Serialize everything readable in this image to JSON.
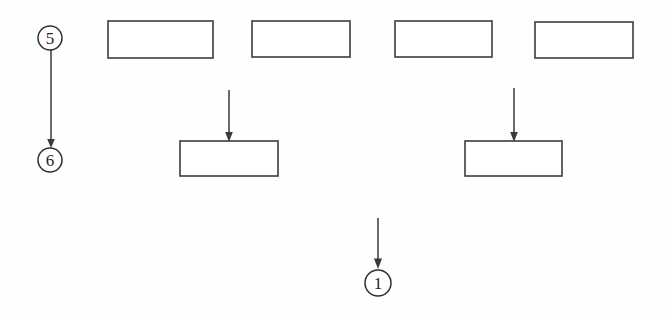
{
  "figure": {
    "title": "",
    "background_color": "#fefefe",
    "line_color": "#3a3a3a",
    "box_fill_color": "#ffffff",
    "width": 671,
    "height": 320
  },
  "boxes": [
    {
      "id": "box-top-1",
      "label": "",
      "x": 108,
      "y": 21,
      "w": 105,
      "h": 37
    },
    {
      "id": "box-top-2",
      "label": "",
      "x": 252,
      "y": 21,
      "w": 98,
      "h": 36
    },
    {
      "id": "box-top-3",
      "label": "",
      "x": 395,
      "y": 21,
      "w": 97,
      "h": 36
    },
    {
      "id": "box-top-4",
      "label": "",
      "x": 535,
      "y": 22,
      "w": 98,
      "h": 36
    },
    {
      "id": "box-mid-1",
      "label": "",
      "x": 180,
      "y": 141,
      "w": 98,
      "h": 35
    },
    {
      "id": "box-mid-2",
      "label": "",
      "x": 465,
      "y": 141,
      "w": 97,
      "h": 35
    }
  ],
  "reference_numerals": [
    {
      "id": "ref-5",
      "text": "5",
      "cx": 50,
      "cy": 38,
      "r": 12
    },
    {
      "id": "ref-6",
      "text": "6",
      "cx": 50,
      "cy": 160,
      "r": 12
    },
    {
      "id": "ref-1",
      "text": "1",
      "cx": 378,
      "cy": 283,
      "r": 13
    }
  ],
  "arrows": [
    {
      "id": "arrow-5-to-6",
      "x": 51,
      "y1": 50,
      "y2": 146,
      "direction": "down"
    },
    {
      "id": "arrow-into-mid-1",
      "x": 229,
      "y1": 90,
      "y2": 140,
      "direction": "down"
    },
    {
      "id": "arrow-into-mid-2",
      "x": 514,
      "y1": 88,
      "y2": 140,
      "direction": "down"
    },
    {
      "id": "arrow-into-ref-1",
      "x": 378,
      "y1": 218,
      "y2": 268,
      "direction": "down"
    }
  ]
}
